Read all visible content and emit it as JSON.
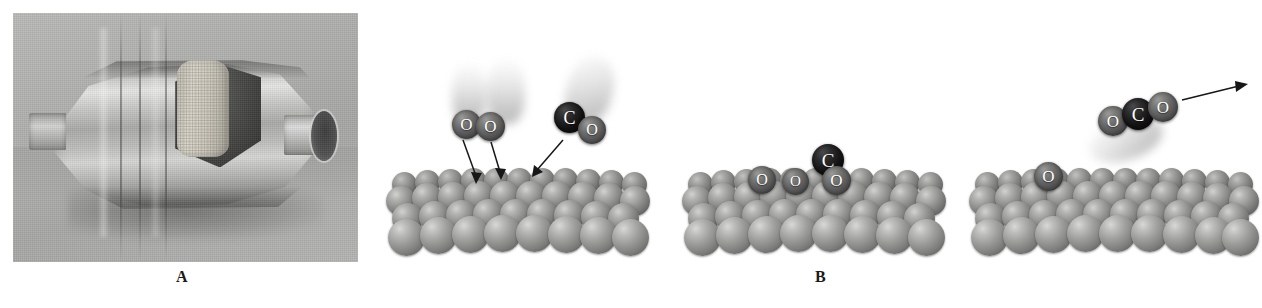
{
  "figure": {
    "background_color": "#ffffff",
    "width": 1262,
    "height": 308
  },
  "panel_a": {
    "label": "A",
    "caption_alt": "Photograph of an automotive catalytic converter with a cut-away section revealing the ceramic honeycomb monolith"
  },
  "panel_b": {
    "label": "B",
    "caption_alt": "Three-stage molecular illustration of carbon monoxide oxidation on a metal catalyst surface",
    "stages": [
      {
        "name": "adsorption",
        "description": "O2 and CO molecules strike the metal surface",
        "molecules": [
          {
            "formula": "O2",
            "atoms": [
              "O",
              "O"
            ]
          },
          {
            "formula": "CO",
            "atoms": [
              "C",
              "O"
            ]
          }
        ],
        "arrow_count": 3,
        "arrow_direction": "down"
      },
      {
        "name": "dissociation",
        "description": "O2 has dissociated into two adsorbed O atoms; CO remains adsorbed",
        "molecules": [
          {
            "formula": "O",
            "atoms": [
              "O"
            ]
          },
          {
            "formula": "O",
            "atoms": [
              "O"
            ]
          },
          {
            "formula": "CO",
            "atoms": [
              "C",
              "O"
            ]
          }
        ],
        "arrow_count": 0,
        "arrow_direction": "none"
      },
      {
        "name": "desorption",
        "description": "Newly formed CO2 leaves the surface, leaving one adsorbed O atom behind",
        "molecules": [
          {
            "formula": "CO2",
            "atoms": [
              "O",
              "C",
              "O"
            ]
          },
          {
            "formula": "O",
            "atoms": [
              "O"
            ]
          }
        ],
        "arrow_count": 1,
        "arrow_direction": "up-right"
      }
    ],
    "atom_labels": {
      "oxygen": "O",
      "carbon": "C"
    },
    "atom_colors": {
      "oxygen": "#5e5e5e",
      "carbon": "#121212",
      "metal": "#8f8f8d"
    }
  }
}
